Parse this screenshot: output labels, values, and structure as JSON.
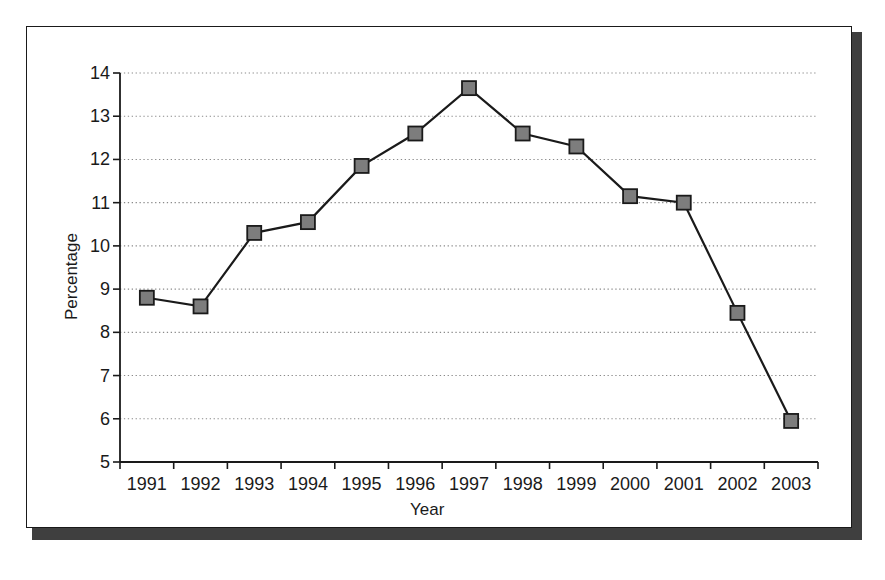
{
  "chart_data": {
    "type": "line",
    "title": "",
    "xlabel": "Year",
    "ylabel": "Percentage",
    "categories": [
      "1991",
      "1992",
      "1993",
      "1994",
      "1995",
      "1996",
      "1997",
      "1998",
      "1999",
      "2000",
      "2001",
      "2002",
      "2003"
    ],
    "values": [
      8.8,
      8.6,
      10.3,
      10.55,
      11.85,
      12.6,
      13.65,
      12.6,
      12.3,
      11.15,
      11.0,
      8.45,
      5.95
    ],
    "series": [
      {
        "name": "Percentage",
        "values": [
          8.8,
          8.6,
          10.3,
          10.55,
          11.85,
          12.6,
          13.65,
          12.6,
          12.3,
          11.15,
          11.0,
          8.45,
          5.95
        ]
      }
    ],
    "ylim": [
      5,
      14
    ],
    "ytick_labels": [
      "5",
      "6",
      "7",
      "8",
      "9",
      "10",
      "11",
      "12",
      "13",
      "14"
    ],
    "ytick_values": [
      5,
      6,
      7,
      8,
      9,
      10,
      11,
      12,
      13,
      14
    ],
    "grid": true,
    "grid_axis": "y",
    "grid_style": "dotted",
    "legend": false,
    "legend_position": "none",
    "marker": "square",
    "colors": {
      "line": "#1a1a1a",
      "marker_fill": "#7d7d7d",
      "marker_edge": "#1a1a1a",
      "grid": "#8a8a8a",
      "axis": "#1a1a1a",
      "text": "#1a1a1a",
      "frame_shadow": "#3f3f3f",
      "background": "#ffffff"
    }
  },
  "geometry": {
    "plot_left": 120,
    "plot_right": 818,
    "plot_top": 73,
    "plot_bottom": 462
  }
}
